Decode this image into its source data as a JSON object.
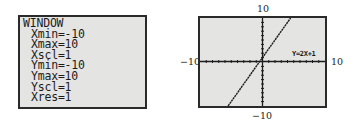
{
  "window_screen": {
    "title": "WINDOW",
    "settings": [
      {
        "name": "Xmin",
        "value": "-10",
        "text": "Xmin=-10"
      },
      {
        "name": "Xmax",
        "value": "10",
        "text": "Xmax=10"
      },
      {
        "name": "Xscl",
        "value": "1",
        "text": "Xscl=1"
      },
      {
        "name": "Ymin",
        "value": "-10",
        "text": "Ymin=-10"
      },
      {
        "name": "Ymax",
        "value": "10",
        "text": "Ymax=10"
      },
      {
        "name": "Yscl",
        "value": "1",
        "text": "Yscl=1"
      },
      {
        "name": "Xres",
        "value": "1",
        "text": "Xres=1"
      }
    ]
  },
  "graph_screen": {
    "function_label": "Y=2X+1",
    "axis_labels": {
      "top": "10",
      "bottom": "−10",
      "left": "−10",
      "right": "10"
    },
    "window": {
      "xmin": -10,
      "xmax": 10,
      "ymin": -10,
      "ymax": 10,
      "xscl": 1,
      "yscl": 1
    },
    "colors": {
      "screen_bg": "#e4e4e2",
      "ink": "#1c1c1c",
      "border": "#2a2a2a"
    }
  }
}
